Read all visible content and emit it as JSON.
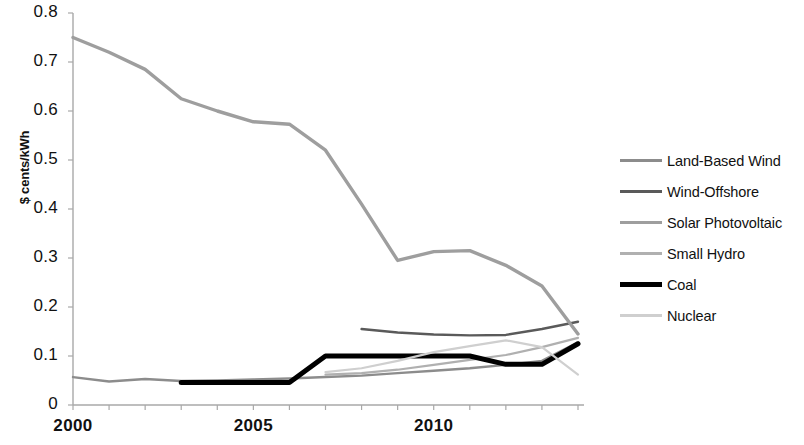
{
  "chart_data": {
    "type": "line",
    "title": "",
    "xlabel": "",
    "ylabel": "$ cents/kWh",
    "xlim": [
      2000,
      2014
    ],
    "ylim": [
      0,
      0.8
    ],
    "grid": false,
    "legend_position": "right",
    "y_ticks": [
      "0.8",
      "0.7",
      "0.6",
      "0.5",
      "0.4",
      "0.3",
      "0.2",
      "0.1",
      "0"
    ],
    "y_tick_values": [
      0.8,
      0.7,
      0.6,
      0.5,
      0.4,
      0.3,
      0.2,
      0.1,
      0
    ],
    "x_ticks": [
      "2000",
      "2005",
      "2010"
    ],
    "x_tick_values": [
      2000,
      2005,
      2010
    ],
    "x_minor_ticks": [
      2000,
      2001,
      2002,
      2003,
      2004,
      2005,
      2006,
      2007,
      2008,
      2009,
      2010,
      2011,
      2012,
      2013,
      2014
    ],
    "series": [
      {
        "name": "Land-Based Wind",
        "color": "#8c8c8c",
        "width": 2.4,
        "x": [
          2000,
          2001,
          2002,
          2003,
          2004,
          2005,
          2006,
          2007,
          2008,
          2009,
          2010,
          2011,
          2012,
          2013,
          2014
        ],
        "values": [
          0.057,
          0.048,
          0.053,
          0.049,
          0.05,
          0.052,
          0.054,
          0.057,
          0.06,
          0.065,
          0.07,
          0.075,
          0.082,
          0.09,
          0.128
        ]
      },
      {
        "name": "Wind-Offshore",
        "color": "#5a5a5a",
        "width": 2.4,
        "x": [
          2008,
          2009,
          2010,
          2011,
          2012,
          2013,
          2014
        ],
        "values": [
          0.155,
          0.148,
          0.144,
          0.142,
          0.143,
          0.155,
          0.17
        ]
      },
      {
        "name": "Solar Photovoltaic",
        "color": "#9e9e9e",
        "width": 3.4,
        "x": [
          2000,
          2001,
          2002,
          2003,
          2004,
          2005,
          2006,
          2007,
          2008,
          2009,
          2010,
          2011,
          2012,
          2013,
          2014
        ],
        "values": [
          0.75,
          0.72,
          0.685,
          0.625,
          0.6,
          0.578,
          0.573,
          0.52,
          0.41,
          0.295,
          0.313,
          0.315,
          0.285,
          0.243,
          0.145
        ]
      },
      {
        "name": "Small Hydro",
        "color": "#b0b0b0",
        "width": 2.2,
        "x": [
          2007,
          2008,
          2009,
          2010,
          2011,
          2012,
          2013,
          2014
        ],
        "values": [
          0.062,
          0.065,
          0.072,
          0.082,
          0.092,
          0.102,
          0.118,
          0.137
        ]
      },
      {
        "name": "Coal",
        "color": "#000000",
        "width": 5.0,
        "x": [
          2003,
          2004,
          2005,
          2006,
          2007,
          2008,
          2009,
          2010,
          2011,
          2012,
          2013,
          2014
        ],
        "values": [
          0.046,
          0.046,
          0.046,
          0.046,
          0.1,
          0.1,
          0.1,
          0.1,
          0.1,
          0.083,
          0.083,
          0.125
        ]
      },
      {
        "name": "Nuclear",
        "color": "#cfcfcf",
        "width": 2.2,
        "x": [
          2007,
          2008,
          2009,
          2010,
          2011,
          2012,
          2013,
          2014
        ],
        "values": [
          0.067,
          0.075,
          0.09,
          0.108,
          0.12,
          0.132,
          0.118,
          0.062
        ]
      }
    ]
  },
  "axes": {
    "y_label": "$ cents/kWh"
  },
  "legend": {
    "items": [
      {
        "label": "Land-Based Wind"
      },
      {
        "label": "Wind-Offshore"
      },
      {
        "label": "Solar Photovoltaic"
      },
      {
        "label": "Small Hydro"
      },
      {
        "label": "Coal"
      },
      {
        "label": "Nuclear"
      }
    ]
  }
}
